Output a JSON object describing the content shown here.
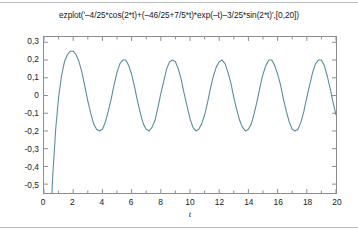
{
  "figure": {
    "title": "ezplot('–4/25*cos(2*t)+(–46/25+7/5*t)*exp(–t)–3/25*sin(2*t)',[0,20])",
    "xaxis_label": "t"
  },
  "colors": {
    "curve": "#5d8d99",
    "axes_border": "#8a8d91",
    "tick": "#8a8d91",
    "text": "#1a1a1a",
    "rule": "#b9bcc0",
    "background": "#ffffff"
  },
  "chart_data": {
    "type": "line",
    "title": "ezplot('–4/25*cos(2*t)+(–46/25+7/5*t)*exp(–t)–3/25*sin(2*t)',[0,20])",
    "xlabel": "t",
    "ylabel": "",
    "expression": "-4/25*cos(2*t)+(-46/25+7/5*t)*exp(-t)-3/25*sin(2*t)",
    "domain": [
      0,
      20
    ],
    "xlim": [
      0,
      20
    ],
    "ylim": [
      -0.55,
      0.33
    ],
    "grid": false,
    "legend": null,
    "box": true,
    "tick_direction": "in",
    "ticks_all_sides": true,
    "decimal_separator": ",",
    "xticks": [
      0,
      2,
      4,
      6,
      8,
      10,
      12,
      14,
      16,
      18,
      20
    ],
    "xtick_labels": [
      "0",
      "2",
      "4",
      "6",
      "8",
      "10",
      "12",
      "14",
      "16",
      "18",
      "20"
    ],
    "xminor_ticks": [
      1,
      3,
      5,
      7,
      9,
      11,
      13,
      15,
      17,
      19
    ],
    "yticks": [
      0.3,
      0.2,
      0.1,
      0,
      -0.1,
      -0.2,
      -0.3,
      -0.4,
      -0.5
    ],
    "ytick_labels": [
      "0,3",
      "0,2",
      "0,1",
      "0",
      "-0,1",
      "-0,2",
      "-0,3",
      "-0,4",
      "-0,5"
    ],
    "series": [
      {
        "name": "y(t)",
        "color": "#5d8d99",
        "line_width": 1,
        "x": [
          0.0,
          0.2,
          0.4,
          0.6,
          0.8,
          1.0,
          1.2,
          1.4,
          1.6,
          1.8,
          2.0,
          2.2,
          2.4,
          2.6,
          2.8,
          3.0,
          3.2,
          3.4,
          3.6,
          3.8,
          4.0,
          4.2,
          4.4,
          4.6,
          4.8,
          5.0,
          5.2,
          5.4,
          5.6,
          5.8,
          6.0,
          6.2,
          6.4,
          6.6,
          6.8,
          7.0,
          7.2,
          7.4,
          7.6,
          7.8,
          8.0,
          8.2,
          8.4,
          8.6,
          8.8,
          9.0,
          9.2,
          9.4,
          9.6,
          9.8,
          10.0,
          10.2,
          10.4,
          10.6,
          10.8,
          11.0,
          11.2,
          11.4,
          11.6,
          11.8,
          12.0,
          12.2,
          12.4,
          12.6,
          12.8,
          13.0,
          13.2,
          13.4,
          13.6,
          13.8,
          14.0,
          14.2,
          14.4,
          14.6,
          14.8,
          15.0,
          15.2,
          15.4,
          15.6,
          15.8,
          16.0,
          16.2,
          16.4,
          16.6,
          16.8,
          17.0,
          17.2,
          17.4,
          17.6,
          17.8,
          18.0,
          18.2,
          18.4,
          18.6,
          18.8,
          19.0,
          19.2,
          19.4,
          19.6,
          19.8,
          20.0
        ],
        "y": [
          -2.0,
          -1.31,
          -0.81,
          -0.45,
          -0.19,
          -0.01,
          0.11,
          0.19,
          0.23,
          0.25,
          0.25,
          0.23,
          0.19,
          0.13,
          0.05,
          -0.03,
          -0.1,
          -0.16,
          -0.19,
          -0.2,
          -0.19,
          -0.15,
          -0.09,
          -0.02,
          0.06,
          0.13,
          0.18,
          0.2,
          0.2,
          0.17,
          0.12,
          0.05,
          -0.03,
          -0.1,
          -0.16,
          -0.19,
          -0.2,
          -0.18,
          -0.14,
          -0.07,
          0.01,
          0.08,
          0.15,
          0.19,
          0.2,
          0.19,
          0.15,
          0.09,
          0.01,
          -0.06,
          -0.13,
          -0.18,
          -0.2,
          -0.19,
          -0.16,
          -0.11,
          -0.04,
          0.04,
          0.11,
          0.16,
          0.19,
          0.2,
          0.18,
          0.13,
          0.07,
          -0.01,
          -0.08,
          -0.14,
          -0.18,
          -0.2,
          -0.19,
          -0.16,
          -0.1,
          -0.03,
          0.05,
          0.12,
          0.17,
          0.2,
          0.2,
          0.17,
          0.12,
          0.06,
          -0.02,
          -0.09,
          -0.15,
          -0.19,
          -0.2,
          -0.19,
          -0.15,
          -0.09,
          -0.01,
          0.06,
          0.13,
          0.18,
          0.2,
          0.2,
          0.17,
          0.11,
          0.04,
          -0.04,
          -0.11
        ]
      }
    ]
  }
}
